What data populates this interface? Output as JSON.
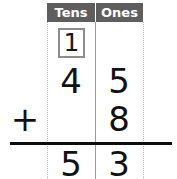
{
  "worksheet": {
    "type": "vertical-addition",
    "columns": [
      {
        "key": "tens",
        "label": "Tens"
      },
      {
        "key": "ones",
        "label": "Ones"
      }
    ],
    "carry": {
      "column": "tens",
      "value": "1"
    },
    "operator": "+",
    "rows": [
      {
        "name": "addend-1",
        "tens": "4",
        "ones": "5"
      },
      {
        "name": "addend-2",
        "tens": "",
        "ones": "8"
      },
      {
        "name": "sum",
        "tens": "5",
        "ones": "3"
      }
    ],
    "equation": "45 + 8 = 53",
    "colors": {
      "header_bg": "#5e5e5e",
      "header_text": "#ffffff",
      "digit": "#111111",
      "rule": "#0d0d0d",
      "grid_solid": "#9a9a9a",
      "grid_dotted": "#b9b9b9",
      "carry_box_border": "#8d8d8d",
      "background": "#ffffff"
    }
  }
}
